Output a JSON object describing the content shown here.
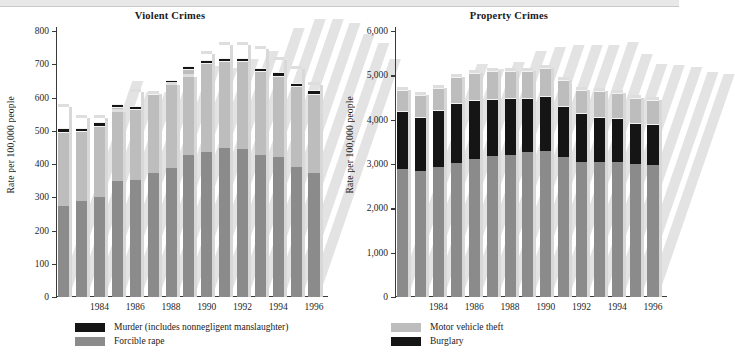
{
  "figure": {
    "ylabel": "Rate per 100,000 people"
  },
  "chart_data": [
    {
      "type": "bar",
      "stacked": true,
      "title": "Violent Crimes",
      "xlabel": "",
      "ylabel": "Rate per 100,000 people",
      "ylim": [
        0,
        800
      ],
      "yticks": [
        0,
        100,
        200,
        300,
        400,
        500,
        600,
        700,
        800
      ],
      "ytick_labels": [
        "0",
        "100",
        "200",
        "300",
        "400",
        "500",
        "600",
        "700",
        "800"
      ],
      "grid": false,
      "legend_position": "below",
      "categories": [
        1982,
        1983,
        1984,
        1985,
        1986,
        1987,
        1988,
        1989,
        1990,
        1991,
        1992,
        1993,
        1994,
        1995,
        1996
      ],
      "xtick_labels": [
        "",
        "",
        "1984",
        "",
        "1986",
        "",
        "1988",
        "",
        "1990",
        "",
        "1992",
        "",
        "1994",
        "",
        "1996"
      ],
      "series": [
        {
          "name": "Aggravated assault and robbery",
          "color": "#8b8b8b",
          "values": [
            275,
            288,
            300,
            348,
            352,
            372,
            388,
            428,
            437,
            448,
            445,
            428,
            420,
            392,
            372
          ]
        },
        {
          "name": "Forcible rape",
          "color": "#bdbdbd",
          "values": [
            222,
            210,
            215,
            222,
            214,
            238,
            254,
            258,
            266,
            262,
            265,
            252,
            246,
            243,
            240
          ]
        },
        {
          "name": "Murder (includes nonnegligent manslaughter)",
          "color": "#151515",
          "values": [
            10,
            10,
            10,
            10,
            10,
            10,
            10,
            10,
            10,
            10,
            10,
            10,
            10,
            10,
            10
          ]
        }
      ],
      "totals": [
        571,
        538,
        539,
        557,
        617,
        610,
        637,
        663,
        732,
        758,
        758,
        747,
        714,
        685,
        637
      ],
      "legend": [
        {
          "label": "Murder (includes nonnegligent manslaughter)",
          "color": "#151515"
        },
        {
          "label": "Forcible rape",
          "color": "#8b8b8b"
        }
      ]
    },
    {
      "type": "bar",
      "stacked": true,
      "title": "Property Crimes",
      "xlabel": "",
      "ylabel": "Rate per 100,000 people",
      "ylim": [
        0,
        6000
      ],
      "yticks": [
        0,
        1000,
        2000,
        3000,
        4000,
        5000,
        6000
      ],
      "ytick_labels": [
        "0",
        "1,000",
        "2,000",
        "3,000",
        "4,000",
        "5,000",
        "6,000"
      ],
      "grid": false,
      "legend_position": "below",
      "categories": [
        1982,
        1983,
        1984,
        1985,
        1986,
        1987,
        1988,
        1989,
        1990,
        1991,
        1992,
        1993,
        1994,
        1995,
        1996
      ],
      "xtick_labels": [
        "",
        "",
        "1984",
        "",
        "1986",
        "",
        "1988",
        "",
        "1990",
        "",
        "1992",
        "",
        "1994",
        "",
        "1996"
      ],
      "series": [
        {
          "name": "Larceny-theft",
          "color": "#8b8b8b",
          "values": [
            2880,
            2840,
            2940,
            3030,
            3120,
            3170,
            3200,
            3280,
            3290,
            3160,
            3050,
            3040,
            3040,
            3000,
            2980
          ]
        },
        {
          "name": "Burglary",
          "color": "#151515",
          "values": [
            1320,
            1230,
            1270,
            1350,
            1330,
            1300,
            1290,
            1200,
            1240,
            1150,
            1090,
            1030,
            1000,
            930,
            920
          ]
        },
        {
          "name": "Motor vehicle theft",
          "color": "#bdbdbd",
          "values": [
            460,
            480,
            500,
            590,
            600,
            620,
            610,
            620,
            640,
            590,
            540,
            570,
            570,
            560,
            540
          ]
        }
      ],
      "totals": [
        4660,
        4550,
        4710,
        4970,
        5050,
        5090,
        5100,
        5100,
        5170,
        4900,
        4680,
        4640,
        4610,
        4490,
        4440
      ],
      "legend": [
        {
          "label": "Motor vehicle theft",
          "color": "#bdbdbd"
        },
        {
          "label": "Burglary",
          "color": "#151515"
        }
      ]
    }
  ]
}
